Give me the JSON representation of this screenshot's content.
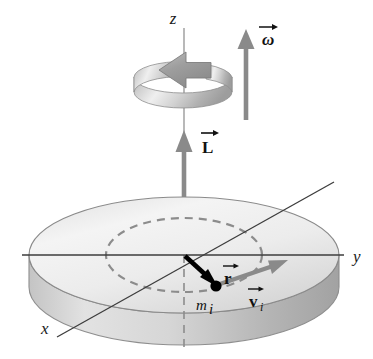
{
  "figure": {
    "type": "physics-vector-diagram",
    "background_color": "#ffffff"
  },
  "axes": {
    "x": {
      "label": "x",
      "x": 47,
      "y": 332
    },
    "y": {
      "label": "y",
      "x": 352,
      "y": 262
    },
    "z": {
      "label": "z",
      "x": 178,
      "y": 22
    }
  },
  "vectors": {
    "angular_momentum": {
      "symbol": "L",
      "label_x": 203,
      "label_y": 152,
      "color": "#8a8a8a",
      "style": "bold-serif-with-overarrow"
    },
    "angular_velocity": {
      "symbol": "ω",
      "label_x": 262,
      "label_y": 45,
      "color": "#8a8a8a",
      "style": "bold-italic-greek-with-overarrow"
    },
    "position": {
      "symbol": "r",
      "label_x": 229,
      "label_y": 282,
      "color": "#000000",
      "style": "bold-serif-with-overarrow"
    },
    "velocity": {
      "symbol": "v",
      "subscript": "i",
      "label_x": 252,
      "label_y": 306,
      "color": "#8a8a8a",
      "style": "bold-serif-with-overarrow"
    }
  },
  "mass_point": {
    "symbol": "m",
    "subscript": "i",
    "label_x": 201,
    "label_y": 309,
    "dot_x": 216,
    "dot_y": 286,
    "color": "#000000"
  },
  "disk": {
    "center_x": 184,
    "center_y": 255,
    "radius_x": 155,
    "radius_y": 58,
    "thickness": 32,
    "top_color_light": "#f2f2f2",
    "top_color_dark": "#c9c9c9",
    "rim_color_light": "#d8d8d8",
    "rim_color_dark": "#a6a6a6",
    "outline_color": "#7a7a7a"
  },
  "dashed_circle": {
    "center_x": 184,
    "center_y": 255,
    "radius_x": 78,
    "radius_y": 37,
    "color": "#8c8c8c",
    "dash": "7,5"
  },
  "rotation_ribbon": {
    "center_x": 183,
    "center_y": 77,
    "radius_x": 49,
    "radius_y": 16,
    "band_height": 26,
    "color_light": "#e6e6e6",
    "color_dark": "#9a9a9a",
    "arrow_direction": "counterclockwise-viewed-from-above"
  },
  "colors": {
    "gray_vector": "#8a8a8a",
    "black_vector": "#000000",
    "axis_line": "#4a4a4a",
    "z_axis_line": "#9b9b9b",
    "dashed_gray": "#8c8c8c"
  }
}
